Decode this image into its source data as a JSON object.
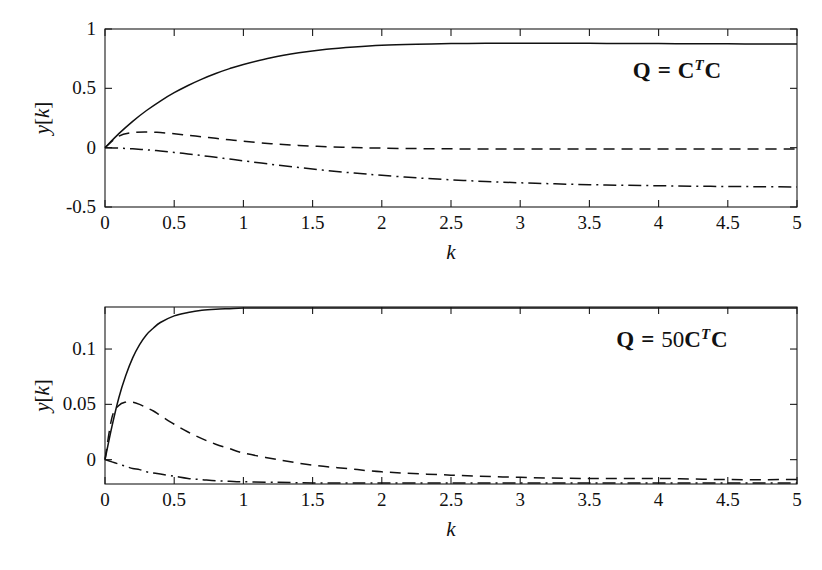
{
  "figure": {
    "background": "#ffffff",
    "line_color": "#111111",
    "panel_count": 2
  },
  "chart_data": [
    {
      "type": "line",
      "panel": "top",
      "title": "",
      "annotation": "Q = C^T C",
      "annotation_parts": {
        "lead": "Q",
        "eq": "=",
        "mat1": "C",
        "sup": "T",
        "mat2": "C",
        "coef": ""
      },
      "xlabel": "k",
      "ylabel": "y[k]",
      "xlim": [
        0,
        5
      ],
      "ylim": [
        -0.5,
        1
      ],
      "xticks": [
        0,
        0.5,
        1,
        1.5,
        2,
        2.5,
        3,
        3.5,
        4,
        4.5,
        5
      ],
      "xticklabels": [
        "0",
        "0.5",
        "1",
        "1.5",
        "2",
        "2.5",
        "3",
        "3.5",
        "4",
        "4.5",
        "5"
      ],
      "yticks": [
        -0.5,
        0,
        0.5,
        1
      ],
      "yticklabels": [
        "-0.5",
        "0",
        "0.5",
        "1"
      ],
      "grid": false,
      "legend": "none",
      "x": [
        0,
        0.1,
        0.2,
        0.3,
        0.4,
        0.5,
        0.6,
        0.7,
        0.8,
        0.9,
        1.0,
        1.2,
        1.4,
        1.6,
        1.8,
        2.0,
        2.25,
        2.5,
        2.75,
        3.0,
        3.25,
        3.5,
        3.75,
        4.0,
        4.25,
        4.5,
        4.75,
        5.0
      ],
      "series": [
        {
          "name": "y1",
          "style": "solid",
          "values": [
            0.0,
            0.118,
            0.222,
            0.313,
            0.393,
            0.463,
            0.524,
            0.578,
            0.625,
            0.666,
            0.701,
            0.758,
            0.799,
            0.829,
            0.849,
            0.863,
            0.872,
            0.877,
            0.879,
            0.88,
            0.88,
            0.879,
            0.878,
            0.877,
            0.876,
            0.875,
            0.874,
            0.873
          ]
        },
        {
          "name": "y2",
          "style": "dashed",
          "values": [
            0.0,
            0.098,
            0.127,
            0.132,
            0.127,
            0.117,
            0.105,
            0.092,
            0.079,
            0.066,
            0.054,
            0.034,
            0.019,
            0.008,
            0.001,
            -0.004,
            -0.008,
            -0.01,
            -0.011,
            -0.012,
            -0.012,
            -0.012,
            -0.012,
            -0.012,
            -0.012,
            -0.012,
            -0.012,
            -0.012
          ]
        },
        {
          "name": "y3",
          "style": "dashdot",
          "values": [
            0.0,
            -0.004,
            -0.01,
            -0.018,
            -0.028,
            -0.04,
            -0.053,
            -0.067,
            -0.081,
            -0.096,
            -0.111,
            -0.14,
            -0.167,
            -0.192,
            -0.214,
            -0.233,
            -0.254,
            -0.271,
            -0.285,
            -0.296,
            -0.305,
            -0.312,
            -0.317,
            -0.321,
            -0.325,
            -0.327,
            -0.329,
            -0.331
          ]
        }
      ]
    },
    {
      "type": "line",
      "panel": "bottom",
      "title": "",
      "annotation": "Q = 50C^T C",
      "annotation_parts": {
        "lead": "Q",
        "eq": "=",
        "coef": "50",
        "mat1": "C",
        "sup": "T",
        "mat2": "C"
      },
      "xlabel": "k",
      "ylabel": "y[k]",
      "xlim": [
        0,
        5
      ],
      "ylim": [
        -0.022,
        0.138
      ],
      "xticks": [
        0,
        0.5,
        1,
        1.5,
        2,
        2.5,
        3,
        3.5,
        4,
        4.5,
        5
      ],
      "xticklabels": [
        "0",
        "0.5",
        "1",
        "1.5",
        "2",
        "2.5",
        "3",
        "3.5",
        "4",
        "4.5",
        "5"
      ],
      "yticks": [
        0,
        0.05,
        0.1
      ],
      "yticklabels": [
        "0",
        "0.05",
        "0.1"
      ],
      "grid": false,
      "legend": "none",
      "x": [
        0,
        0.05,
        0.1,
        0.15,
        0.2,
        0.25,
        0.3,
        0.35,
        0.4,
        0.5,
        0.6,
        0.7,
        0.8,
        0.9,
        1.0,
        1.25,
        1.5,
        1.75,
        2.0,
        2.5,
        3.0,
        3.5,
        4.0,
        4.5,
        5.0
      ],
      "series": [
        {
          "name": "y1",
          "style": "solid",
          "values": [
            0.0,
            0.03,
            0.056,
            0.076,
            0.092,
            0.104,
            0.113,
            0.119,
            0.124,
            0.13,
            0.133,
            0.135,
            0.136,
            0.1365,
            0.137,
            0.137,
            0.137,
            0.137,
            0.137,
            0.137,
            0.137,
            0.137,
            0.137,
            0.137,
            0.137
          ]
        },
        {
          "name": "y2",
          "style": "dashed",
          "values": [
            0.0,
            0.038,
            0.049,
            0.052,
            0.052,
            0.05,
            0.047,
            0.044,
            0.04,
            0.032,
            0.025,
            0.019,
            0.014,
            0.01,
            0.006,
            0.0,
            -0.005,
            -0.008,
            -0.011,
            -0.014,
            -0.016,
            -0.017,
            -0.017,
            -0.018,
            -0.018
          ]
        },
        {
          "name": "y3",
          "style": "dashdot",
          "values": [
            0.0,
            -0.002,
            -0.004,
            -0.006,
            -0.008,
            -0.009,
            -0.011,
            -0.012,
            -0.013,
            -0.015,
            -0.017,
            -0.018,
            -0.019,
            -0.0195,
            -0.02,
            -0.0205,
            -0.021,
            -0.021,
            -0.021,
            -0.021,
            -0.021,
            -0.021,
            -0.021,
            -0.021,
            -0.021
          ]
        }
      ]
    }
  ]
}
